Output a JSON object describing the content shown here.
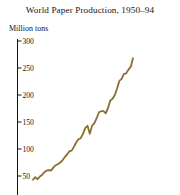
{
  "chart": {
    "title": "World Paper Production, 1950–94",
    "y_axis_label": "Million tons"
  },
  "chart_data": {
    "type": "line",
    "title": "World Paper Production, 1950–94",
    "subtitle": "",
    "xlabel": "",
    "ylabel": "Million tons",
    "ylim": [
      40,
      300
    ],
    "xlim": [
      1950,
      1994
    ],
    "grid": false,
    "legend": "none",
    "yticks": [
      300,
      250,
      200,
      150,
      100,
      50
    ],
    "ytick_labels": [
      "300",
      "250",
      "200",
      "150",
      "100",
      "50"
    ],
    "xticks": [],
    "xtick_labels": [],
    "line_color": "#8a6e2f",
    "line_width": 1.8,
    "series": [
      {
        "name": "World paper production",
        "x": [
          1950,
          1951,
          1952,
          1953,
          1954,
          1955,
          1956,
          1957,
          1958,
          1959,
          1960,
          1961,
          1962,
          1963,
          1964,
          1965,
          1966,
          1967,
          1968,
          1969,
          1970,
          1971,
          1972,
          1973,
          1974,
          1975,
          1976,
          1977,
          1978,
          1979,
          1980,
          1981,
          1982,
          1983,
          1984,
          1985,
          1986,
          1987,
          1988,
          1989,
          1990,
          1991,
          1992,
          1993,
          1994
        ],
        "values": [
          43,
          48,
          44,
          49,
          52,
          57,
          60,
          61,
          60,
          66,
          70,
          72,
          75,
          79,
          85,
          90,
          96,
          97,
          104,
          112,
          118,
          120,
          128,
          139,
          143,
          128,
          143,
          148,
          157,
          168,
          170,
          170,
          166,
          176,
          190,
          193,
          200,
          212,
          226,
          230,
          239,
          240,
          247,
          252,
          268
        ]
      }
    ]
  }
}
